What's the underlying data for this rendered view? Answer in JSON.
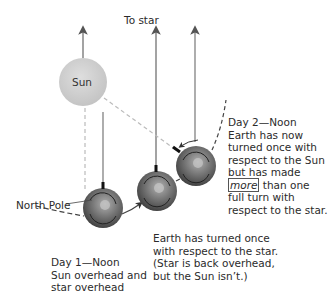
{
  "labels": {
    "to_star": "To star",
    "sun": "Sun",
    "north_pole": "North Pole",
    "day1": {
      "title": "Day 1—Noon",
      "line1": "Sun overhead and",
      "line2": "star overhead"
    },
    "middle": {
      "line1": "Earth has turned once",
      "line2": "with respect to the star.",
      "line3": "(Star is back overhead,",
      "line4": "but the Sun isn’t.)"
    },
    "day2": {
      "title": "Day 2—Noon",
      "line1": "Earth has now",
      "line2": "turned once with",
      "line3": "respect to the Sun",
      "line4": "but has made",
      "emphasis": "more",
      "line5_rest": " than one",
      "line6": "full turn with",
      "line7": "respect to the star."
    }
  },
  "colors": {
    "sun_fill": "#cfcfcf",
    "earth_fill": "#6e6e6e",
    "arrow": "#555555",
    "dashed_orbit": "#444444",
    "dashed_sunline": "#bbbbbb"
  }
}
